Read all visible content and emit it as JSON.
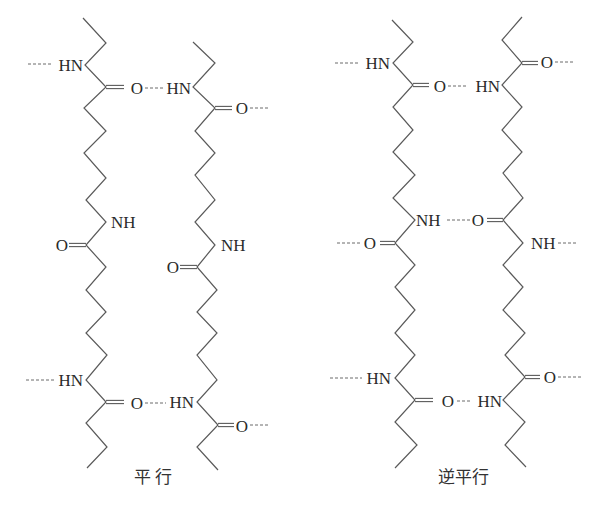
{
  "colors": {
    "line": "#5a5a5a",
    "text": "#2a2a2a",
    "background": "#ffffff"
  },
  "figures": [
    {
      "id": "parallel",
      "caption": "平 行",
      "caption_pos": [
        153,
        477
      ],
      "chains": [
        {
          "name": "strand-a",
          "points": [
            [
              83,
              18
            ],
            [
              106,
              43
            ],
            [
              85,
              65
            ],
            [
              106,
              87
            ],
            [
              84,
              108
            ],
            [
              106,
              131
            ],
            [
              84,
              153
            ],
            [
              106,
              178
            ],
            [
              86,
              200
            ],
            [
              106,
              222
            ],
            [
              86,
              245
            ],
            [
              106,
              267
            ],
            [
              86,
              290
            ],
            [
              106,
              312
            ],
            [
              86,
              333
            ],
            [
              107,
              355
            ],
            [
              86,
              380
            ],
            [
              106,
              402
            ],
            [
              86,
              423
            ],
            [
              107,
              447
            ],
            [
              87,
              468
            ]
          ]
        },
        {
          "name": "strand-b",
          "points": [
            [
              193,
              42
            ],
            [
              215,
              63
            ],
            [
              193,
              87
            ],
            [
              215,
              108
            ],
            [
              195,
              131
            ],
            [
              215,
              153
            ],
            [
              195,
              175
            ],
            [
              215,
              200
            ],
            [
              195,
              222
            ],
            [
              215,
              245
            ],
            [
              197,
              267
            ],
            [
              217,
              290
            ],
            [
              197,
              312
            ],
            [
              217,
              333
            ],
            [
              197,
              355
            ],
            [
              217,
              380
            ],
            [
              197,
              402
            ],
            [
              218,
              425
            ],
            [
              197,
              447
            ],
            [
              218,
              470
            ]
          ]
        }
      ],
      "carbonyls": [
        {
          "from": [
            106,
            87
          ],
          "to": [
            124,
            87
          ]
        },
        {
          "from": [
            86,
            245
          ],
          "to": [
            69,
            245
          ]
        },
        {
          "from": [
            106,
            402
          ],
          "to": [
            124,
            402
          ]
        },
        {
          "from": [
            215,
            108
          ],
          "to": [
            232,
            108
          ]
        },
        {
          "from": [
            197,
            267
          ],
          "to": [
            180,
            267
          ]
        },
        {
          "from": [
            218,
            425
          ],
          "to": [
            234,
            425
          ]
        }
      ],
      "hbonds": [
        {
          "from": [
            28,
            64
          ],
          "to": [
            53,
            64
          ]
        },
        {
          "from": [
            145,
            88
          ],
          "to": [
            163,
            88
          ]
        },
        {
          "from": [
            250,
            108
          ],
          "to": [
            270,
            108
          ]
        },
        {
          "from": [
            26,
            380
          ],
          "to": [
            55,
            380
          ]
        },
        {
          "from": [
            145,
            403
          ],
          "to": [
            166,
            403
          ]
        },
        {
          "from": [
            250,
            425
          ],
          "to": [
            270,
            425
          ]
        }
      ],
      "atoms": [
        {
          "text": "HN",
          "x": 83,
          "y": 65,
          "anchor": "end"
        },
        {
          "text": "O",
          "x": 137,
          "y": 88,
          "anchor": "middle"
        },
        {
          "text": "HN",
          "x": 191,
          "y": 88,
          "anchor": "end"
        },
        {
          "text": "O",
          "x": 242,
          "y": 108,
          "anchor": "middle"
        },
        {
          "text": "NH",
          "x": 111,
          "y": 222,
          "anchor": "start"
        },
        {
          "text": "O",
          "x": 62,
          "y": 245,
          "anchor": "middle"
        },
        {
          "text": "NH",
          "x": 221,
          "y": 245,
          "anchor": "start"
        },
        {
          "text": "O",
          "x": 173,
          "y": 267,
          "anchor": "middle"
        },
        {
          "text": "HN",
          "x": 83,
          "y": 380,
          "anchor": "end"
        },
        {
          "text": "O",
          "x": 137,
          "y": 403,
          "anchor": "middle"
        },
        {
          "text": "HN",
          "x": 194,
          "y": 402,
          "anchor": "end"
        },
        {
          "text": "O",
          "x": 242,
          "y": 426,
          "anchor": "middle"
        }
      ]
    },
    {
      "id": "antiparallel",
      "caption": "逆平行",
      "caption_pos": [
        463,
        477
      ],
      "chains": [
        {
          "name": "strand-c",
          "points": [
            [
              392,
              20
            ],
            [
              413,
              42
            ],
            [
              393,
              63
            ],
            [
              413,
              85
            ],
            [
              393,
              107
            ],
            [
              413,
              130
            ],
            [
              393,
              152
            ],
            [
              415,
              175
            ],
            [
              393,
              198
            ],
            [
              415,
              220
            ],
            [
              395,
              243
            ],
            [
              415,
              265
            ],
            [
              395,
              287
            ],
            [
              415,
              310
            ],
            [
              395,
              333
            ],
            [
              415,
              355
            ],
            [
              395,
              378
            ],
            [
              415,
              400
            ],
            [
              395,
              422
            ],
            [
              417,
              445
            ],
            [
              395,
              468
            ]
          ]
        },
        {
          "name": "strand-d",
          "points": [
            [
              522,
              17
            ],
            [
              502,
              40
            ],
            [
              522,
              63
            ],
            [
              502,
              85
            ],
            [
              522,
              107
            ],
            [
              502,
              130
            ],
            [
              522,
              152
            ],
            [
              503,
              173
            ],
            [
              523,
              198
            ],
            [
              503,
              220
            ],
            [
              523,
              243
            ],
            [
              503,
              265
            ],
            [
              523,
              287
            ],
            [
              503,
              310
            ],
            [
              525,
              333
            ],
            [
              505,
              355
            ],
            [
              525,
              377
            ],
            [
              503,
              400
            ],
            [
              525,
              422
            ],
            [
              505,
              445
            ],
            [
              526,
              467
            ]
          ]
        }
      ],
      "carbonyls": [
        {
          "from": [
            413,
            85
          ],
          "to": [
            429,
            85
          ]
        },
        {
          "from": [
            522,
            63
          ],
          "to": [
            538,
            63
          ]
        },
        {
          "from": [
            503,
            220
          ],
          "to": [
            487,
            220
          ]
        },
        {
          "from": [
            395,
            243
          ],
          "to": [
            380,
            243
          ]
        },
        {
          "from": [
            415,
            400
          ],
          "to": [
            433,
            400
          ]
        },
        {
          "from": [
            525,
            377
          ],
          "to": [
            540,
            377
          ]
        }
      ],
      "hbonds": [
        {
          "from": [
            335,
            63
          ],
          "to": [
            360,
            63
          ]
        },
        {
          "from": [
            448,
            86
          ],
          "to": [
            468,
            86
          ]
        },
        {
          "from": [
            555,
            62
          ],
          "to": [
            575,
            62
          ]
        },
        {
          "from": [
            447,
            220
          ],
          "to": [
            471,
            220
          ]
        },
        {
          "from": [
            337,
            243
          ],
          "to": [
            362,
            243
          ]
        },
        {
          "from": [
            558,
            243
          ],
          "to": [
            578,
            243
          ]
        },
        {
          "from": [
            330,
            378
          ],
          "to": [
            362,
            378
          ]
        },
        {
          "from": [
            457,
            401
          ],
          "to": [
            472,
            401
          ]
        },
        {
          "from": [
            558,
            377
          ],
          "to": [
            582,
            377
          ]
        }
      ],
      "atoms": [
        {
          "text": "HN",
          "x": 390,
          "y": 63,
          "anchor": "end"
        },
        {
          "text": "O",
          "x": 440,
          "y": 86,
          "anchor": "middle"
        },
        {
          "text": "HN",
          "x": 500,
          "y": 86,
          "anchor": "end"
        },
        {
          "text": "O",
          "x": 547,
          "y": 62,
          "anchor": "middle"
        },
        {
          "text": "NH",
          "x": 416,
          "y": 220,
          "anchor": "start"
        },
        {
          "text": "O",
          "x": 478,
          "y": 220,
          "anchor": "middle"
        },
        {
          "text": "O",
          "x": 370,
          "y": 243,
          "anchor": "middle"
        },
        {
          "text": "NH",
          "x": 531,
          "y": 243,
          "anchor": "start"
        },
        {
          "text": "HN",
          "x": 391,
          "y": 378,
          "anchor": "end"
        },
        {
          "text": "O",
          "x": 448,
          "y": 401,
          "anchor": "middle"
        },
        {
          "text": "HN",
          "x": 502,
          "y": 401,
          "anchor": "end"
        },
        {
          "text": "O",
          "x": 550,
          "y": 377,
          "anchor": "middle"
        }
      ]
    }
  ]
}
